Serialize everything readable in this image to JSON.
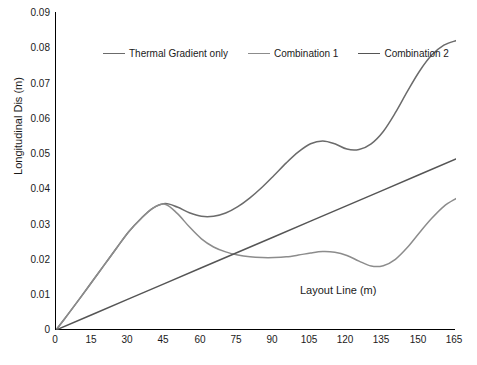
{
  "chart_data": {
    "type": "line",
    "title": "",
    "xlabel": "Layout Line (m)",
    "ylabel": "Longitudinal  Dis (m)",
    "xlim": [
      0,
      165
    ],
    "ylim": [
      0,
      0.09
    ],
    "grid": false,
    "legend_position": "top-left-inside",
    "x_ticks": [
      "0",
      "15",
      "30",
      "45",
      "60",
      "75",
      "90",
      "105",
      "120",
      "135",
      "150",
      "165"
    ],
    "y_ticks": [
      "0",
      "0.01",
      "0.02",
      "0.03",
      "0.04",
      "0.05",
      "0.06",
      "0.07",
      "0.08",
      "0.09"
    ],
    "series": [
      {
        "name": "Thermal Gradient only",
        "color": "#6b6b6b",
        "x": [
          0,
          5,
          10,
          15,
          20,
          25,
          30,
          35,
          40,
          45,
          50,
          55,
          60,
          65,
          70,
          75,
          80,
          85,
          90,
          95,
          100,
          105,
          110,
          115,
          120,
          125,
          130,
          135,
          140,
          145,
          150,
          155,
          160,
          165
        ],
        "y": [
          0.0,
          0.0045,
          0.0091,
          0.0138,
          0.0185,
          0.0232,
          0.0278,
          0.0315,
          0.0345,
          0.0358,
          0.0348,
          0.0332,
          0.0322,
          0.0322,
          0.0331,
          0.0349,
          0.0374,
          0.0404,
          0.0438,
          0.0473,
          0.0504,
          0.0527,
          0.0535,
          0.0527,
          0.0512,
          0.0511,
          0.0527,
          0.0562,
          0.0615,
          0.0676,
          0.0733,
          0.0778,
          0.0806,
          0.0819
        ]
      },
      {
        "name": "Combination 1",
        "color": "#8c8c8c",
        "x": [
          0,
          5,
          10,
          15,
          20,
          25,
          30,
          35,
          40,
          45,
          50,
          55,
          60,
          65,
          70,
          75,
          80,
          85,
          90,
          95,
          100,
          105,
          110,
          115,
          120,
          125,
          130,
          135,
          140,
          145,
          150,
          155,
          160,
          165
        ],
        "y": [
          0.0,
          0.0045,
          0.0091,
          0.0138,
          0.0185,
          0.0232,
          0.0278,
          0.0315,
          0.0345,
          0.0356,
          0.033,
          0.0292,
          0.0258,
          0.0235,
          0.0221,
          0.0212,
          0.0207,
          0.0205,
          0.0205,
          0.0207,
          0.0212,
          0.0218,
          0.0222,
          0.022,
          0.0211,
          0.0195,
          0.0181,
          0.0182,
          0.02,
          0.0234,
          0.0276,
          0.0316,
          0.035,
          0.0372
        ]
      },
      {
        "name": "Combination 2",
        "color": "#555555",
        "x": [
          0,
          15,
          30,
          45,
          60,
          75,
          90,
          105,
          120,
          135,
          150,
          165
        ],
        "y": [
          0.0,
          0.0044,
          0.0088,
          0.0132,
          0.0176,
          0.022,
          0.0264,
          0.0308,
          0.0352,
          0.0396,
          0.044,
          0.0484
        ]
      }
    ]
  },
  "legend": {
    "items": [
      {
        "label": "Thermal Gradient only"
      },
      {
        "label": "Combination 1"
      },
      {
        "label": "Combination 2"
      }
    ]
  }
}
